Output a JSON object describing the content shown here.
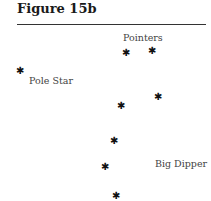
{
  "figure": {
    "title": "Figure 15b"
  },
  "labels": {
    "pointers": "Pointers",
    "pole_star": "Pole Star",
    "big_dipper": "Big Dipper"
  },
  "star_glyph": "✱",
  "stars": [
    {
      "name": "pole-star",
      "x": 20,
      "y": 71
    },
    {
      "name": "pointer-1",
      "x": 126,
      "y": 53
    },
    {
      "name": "pointer-2",
      "x": 152,
      "y": 51
    },
    {
      "name": "dipper-star-3",
      "x": 158,
      "y": 97
    },
    {
      "name": "dipper-star-4",
      "x": 121,
      "y": 106
    },
    {
      "name": "dipper-star-5",
      "x": 114,
      "y": 141
    },
    {
      "name": "dipper-star-6",
      "x": 105,
      "y": 167
    },
    {
      "name": "dipper-star-7",
      "x": 116,
      "y": 196
    }
  ]
}
